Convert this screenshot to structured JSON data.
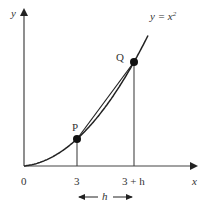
{
  "diagram": {
    "type": "secant-on-parabola",
    "curve_label": "y = x",
    "curve_label_exponent": "2",
    "axis_labels": {
      "x": "x",
      "y": "y"
    },
    "origin_label": "0",
    "points": [
      {
        "name": "P",
        "x_label": "3"
      },
      {
        "name": "Q",
        "x_label": "3 + h"
      }
    ],
    "interval_label": "h",
    "colors": {
      "ink": "#222222",
      "axis": "#444444"
    }
  }
}
